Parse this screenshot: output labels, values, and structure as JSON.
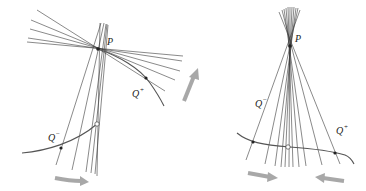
{
  "colors": {
    "line": "#3a3a3a",
    "curve": "#555555",
    "arrow": "#a8a8a8",
    "point": "#222222"
  },
  "left_panel": {
    "label_P": "P",
    "label_Qplus": "Q",
    "label_Qplus_sup": "+",
    "label_Qminus": "Q",
    "label_Qminus_sup": "−",
    "P": [
      98,
      49
    ],
    "Q_plus": [
      146,
      78
    ],
    "Q_minus": [
      61,
      148
    ],
    "open_point": [
      97,
      124
    ],
    "arrows": [
      "right (bottom)",
      "up-right (along curve)"
    ]
  },
  "right_panel": {
    "label_P": "P",
    "label_Qplus": "Q",
    "label_Qplus_sup": "+",
    "label_Qminus": "Q",
    "label_Qminus_sup": "−",
    "P": [
      290,
      46
    ],
    "Q_plus": [
      335,
      153
    ],
    "Q_minus": [
      253,
      142
    ],
    "open_point": [
      288,
      147
    ],
    "arrows": [
      "right (bottom-left)",
      "left (bottom-right)"
    ]
  }
}
